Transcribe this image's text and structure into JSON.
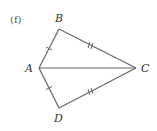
{
  "part_label": "(f)",
  "points": {
    "A": {
      "label": "A",
      "x": 39,
      "y": 68
    },
    "B": {
      "label": "B",
      "x": 59,
      "y": 29
    },
    "C": {
      "label": "C",
      "x": 136,
      "y": 68
    },
    "D": {
      "label": "D",
      "x": 59,
      "y": 108
    }
  },
  "segments": [
    {
      "from": "A",
      "to": "B",
      "ticks": 1
    },
    {
      "from": "B",
      "to": "C",
      "ticks": 2
    },
    {
      "from": "A",
      "to": "C",
      "ticks": 0
    },
    {
      "from": "A",
      "to": "D",
      "ticks": 1
    },
    {
      "from": "D",
      "to": "C",
      "ticks": 2
    }
  ],
  "colors": {
    "line": "#666666",
    "text": "#333333"
  }
}
